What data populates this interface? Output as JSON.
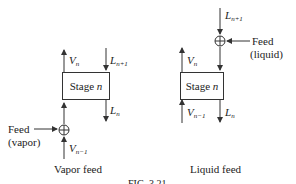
{
  "left": {
    "caption": "Vapor feed",
    "stage_label": "Stage",
    "stage_var": "n",
    "streams": {
      "v_out": {
        "base": "V",
        "sub": "n"
      },
      "l_in": {
        "base": "L",
        "sub": "n+1"
      },
      "l_out": {
        "base": "L",
        "sub": "n"
      },
      "v_in": {
        "base": "V",
        "sub": "n−1"
      }
    },
    "feed_label": "Feed",
    "feed_phase": "(vapor)"
  },
  "right": {
    "caption": "Liquid feed",
    "stage_label": "Stage",
    "stage_var": "n",
    "streams": {
      "v_out": {
        "base": "V",
        "sub": "n"
      },
      "l_in": {
        "base": "L",
        "sub": "n+1"
      },
      "l_out": {
        "base": "L",
        "sub": "n"
      },
      "v_in": {
        "base": "V",
        "sub": "n−1"
      }
    },
    "feed_label": "Feed",
    "feed_phase": "(liquid)"
  },
  "figure_caption": "FIG. 3.21"
}
